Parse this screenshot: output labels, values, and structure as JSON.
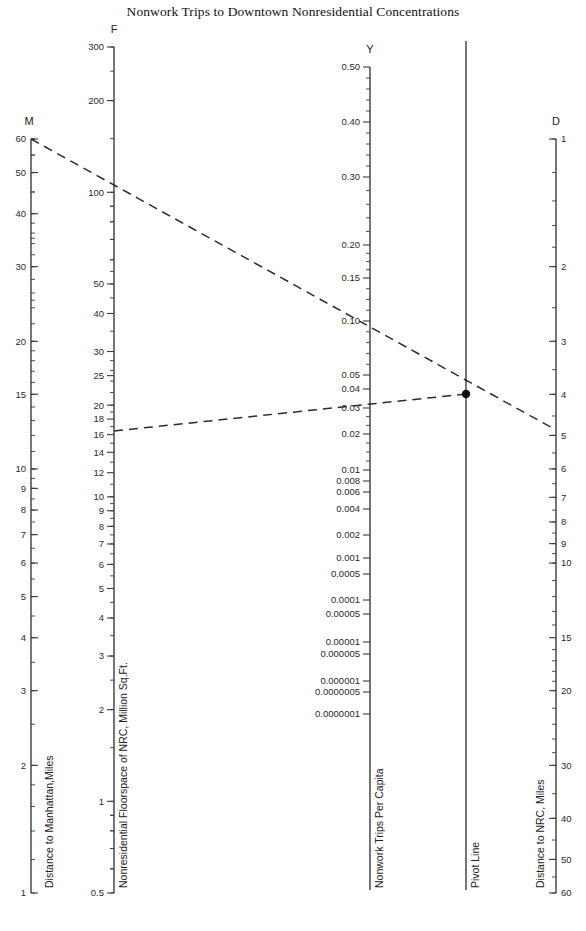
{
  "title": "Nonwork Trips to Downtown Nonresidential Concentrations",
  "axes": {
    "M": {
      "head": "M",
      "name": "Distance to Manhattan,Miles",
      "x": 31,
      "y_top": 139,
      "y_bottom": 893,
      "scale": "log",
      "top_value": 60,
      "bottom_value": 1,
      "direction": "down",
      "labels": [
        60,
        50,
        40,
        30,
        20,
        15,
        10,
        9,
        8,
        7,
        6,
        5,
        4,
        3,
        2,
        1
      ]
    },
    "F": {
      "head": "F",
      "name": "Nonresidential Floorspace of NRC, Million Sq.Ft.",
      "x": 114,
      "y_top": 47,
      "y_bottom": 893,
      "scale": "log",
      "top_value": 300,
      "bottom_value": 0.5,
      "direction": "down",
      "labels": [
        300,
        200,
        100,
        50,
        40,
        30,
        25,
        20,
        18,
        16,
        14,
        12,
        10,
        9,
        8,
        7,
        6,
        5,
        4,
        3,
        2,
        1,
        0.5
      ]
    },
    "Y": {
      "head": "Y",
      "name": "Nonwork Trips Per Capita",
      "x": 370,
      "y_top": 67,
      "y_bottom": 890,
      "scale": "log-segmented",
      "labels": [
        "0.50",
        "0.40",
        "0.30",
        "0.20",
        "0.15",
        "0.10",
        "0.05",
        "0.04",
        "0.03",
        "0.02",
        "0.01",
        "0.008",
        "0.006",
        "0.004",
        "0.002",
        "0.001",
        "0.0005",
        "0.0001",
        "0.00005",
        "0.00001",
        "0.000005",
        "0.000001",
        "0.0000005",
        "0.0000001"
      ]
    },
    "P": {
      "head": "",
      "name": "Pivot Line",
      "x": 466,
      "y_top": 41,
      "y_bottom": 890
    },
    "D": {
      "head": "D",
      "name": "Distance to NRC, Miles",
      "x": 556,
      "y_top": 139,
      "y_bottom": 893,
      "scale": "log",
      "top_value": 1,
      "bottom_value": 60,
      "direction": "down-increasing",
      "labels": [
        1,
        2,
        3,
        4,
        5,
        6,
        7,
        8,
        9,
        10,
        15,
        20,
        30,
        40,
        50,
        60
      ]
    }
  },
  "construction": {
    "line1": {
      "from_axis": "M",
      "from_value": 60,
      "through": "pivot",
      "to_axis": "Y",
      "y_value": 0.085
    },
    "line2": {
      "from_axis": "F",
      "from_value": 10,
      "through": "pivot",
      "to_axis": "D",
      "d_value": 5
    },
    "pivot_point": {
      "x": 466,
      "y": 394
    }
  },
  "chart_data": {
    "type": "line",
    "title": "Nonwork Trips to Downtown Nonresidential Concentrations",
    "subtype": "nomogram",
    "xlabel": "",
    "ylabel": "",
    "grid": false,
    "legend": "none",
    "scales": [
      {
        "name": "M",
        "label": "Distance to Manhattan,Miles",
        "ticks": [
          60,
          50,
          40,
          30,
          20,
          15,
          10,
          9,
          8,
          7,
          6,
          5,
          4,
          3,
          2,
          1
        ],
        "range": [
          1,
          60
        ],
        "type": "log",
        "orientation": "vertical-descending"
      },
      {
        "name": "F",
        "label": "Nonresidential Floorspace of NRC, Million Sq.Ft.",
        "ticks": [
          300,
          200,
          100,
          50,
          40,
          30,
          25,
          20,
          18,
          16,
          14,
          12,
          10,
          9,
          8,
          7,
          6,
          5,
          4,
          3,
          2,
          1,
          0.5
        ],
        "range": [
          0.5,
          300
        ],
        "type": "log",
        "orientation": "vertical-descending"
      },
      {
        "name": "Y",
        "label": "Nonwork Trips Per Capita",
        "ticks": [
          0.5,
          0.4,
          0.3,
          0.2,
          0.15,
          0.1,
          0.05,
          0.04,
          0.03,
          0.02,
          0.01,
          0.008,
          0.006,
          0.004,
          0.002,
          0.001,
          0.0005,
          0.0001,
          5e-05,
          1e-05,
          5e-06,
          1e-06,
          5e-07,
          1e-07
        ],
        "range": [
          1e-07,
          0.5
        ],
        "type": "log",
        "orientation": "vertical-descending"
      },
      {
        "name": "Pivot Line",
        "label": "Pivot Line",
        "ticks": [],
        "type": "reference"
      },
      {
        "name": "D",
        "label": "Distance to NRC, Miles",
        "ticks": [
          1,
          2,
          3,
          4,
          5,
          6,
          7,
          8,
          9,
          10,
          15,
          20,
          30,
          40,
          50,
          60
        ],
        "range": [
          1,
          60
        ],
        "type": "log",
        "orientation": "vertical-increasing"
      }
    ],
    "series": [
      {
        "name": "Construction line 1",
        "points": [
          [
            "M",
            60
          ],
          [
            "Y",
            0.085
          ],
          [
            "pivot",
            null
          ],
          [
            "D",
            5
          ]
        ],
        "style": "dashed"
      },
      {
        "name": "Construction line 2",
        "points": [
          [
            "F",
            10
          ],
          [
            "Y",
            0.033
          ],
          [
            "pivot",
            null
          ]
        ],
        "style": "dashed"
      }
    ],
    "annotations": [
      {
        "type": "point",
        "label": "pivot intersection",
        "at": "Pivot Line"
      }
    ]
  }
}
